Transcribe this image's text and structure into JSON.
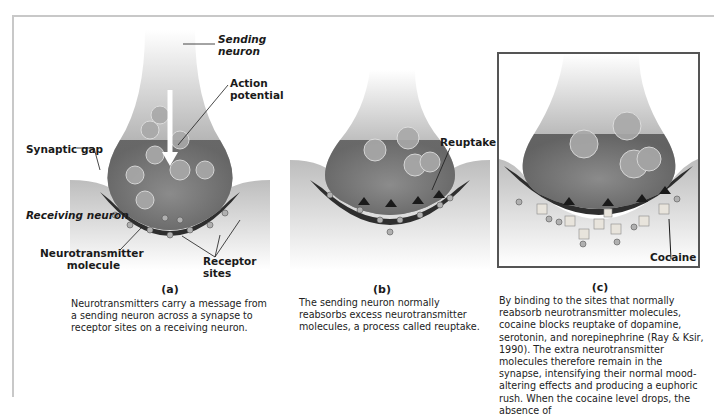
{
  "figure": {
    "panel_a": {
      "caption": "(a)",
      "labels": {
        "sending_neuron": "Sending neuron",
        "action_potential": "Action potential",
        "synaptic_gap": "Synaptic gap",
        "receiving_neuron": "Receiving neuron",
        "neurotransmitter_molecule": "Neurotransmitter molecule",
        "receptor_sites": "Receptor sites"
      },
      "description": "Neurotransmitters carry a message from a sending neuron across a synapse to receptor sites on a receiving neuron."
    },
    "panel_b": {
      "caption": "(b)",
      "labels": {
        "reuptake": "Reuptake"
      },
      "description": "The sending neuron normally reabsorbs excess neurotransmitter molecules, a process called reuptake."
    },
    "panel_c": {
      "caption": "(c)",
      "labels": {
        "cocaine": "Cocaine"
      },
      "description": "By binding to the sites that normally reabsorb neurotransmitter molecules, cocaine blocks reuptake of dopamine, serotonin, and norepinephrine (Ray & Ksir, 1990). The extra neurotransmitter molecules therefore remain in the synapse, intensifying their normal mood-altering effects and producing a euphoric rush. When the cocaine level drops, the absence of"
    }
  }
}
